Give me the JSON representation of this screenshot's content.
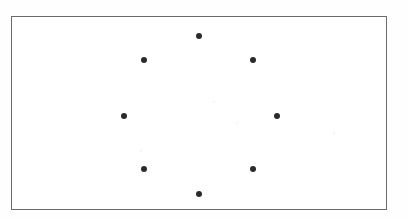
{
  "figure": {
    "canvas": {
      "width": 409,
      "height": 218
    },
    "background_color": "#ffffff",
    "frame": {
      "name": "plot-border",
      "x": 11,
      "y": 16,
      "width": 376,
      "height": 194,
      "border_color": "#6b6b6b",
      "border_width": 1.5,
      "fill_color": "#ffffff"
    },
    "marker_style": {
      "shape": "circle",
      "radius": 3.1,
      "color": "#2b2b2b",
      "count": 8
    }
  },
  "chart_data": {
    "type": "scatter",
    "title": "",
    "subtitle": "",
    "xlabel": "",
    "ylabel": "",
    "grid": false,
    "legend": null,
    "axes_visible": false,
    "frame_visible": true,
    "xlim": [
      11,
      387
    ],
    "ylim": [
      16,
      210
    ],
    "center": {
      "x": 200.5,
      "y": 115
    },
    "ring_radius_x": 77,
    "ring_radius_y": 79,
    "series": [
      {
        "name": "markers",
        "color": "#2b2b2b",
        "marker": "circle",
        "points": [
          {
            "label": "top",
            "angle_deg": 90,
            "x": 199,
            "y": 36
          },
          {
            "label": "upper-left",
            "angle_deg": 135,
            "x": 144,
            "y": 60
          },
          {
            "label": "upper-right",
            "angle_deg": 45,
            "x": 253,
            "y": 60
          },
          {
            "label": "left",
            "angle_deg": 180,
            "x": 124,
            "y": 116
          },
          {
            "label": "right",
            "angle_deg": 0,
            "x": 277,
            "y": 116
          },
          {
            "label": "lower-left",
            "angle_deg": 225,
            "x": 144,
            "y": 169
          },
          {
            "label": "lower-right",
            "angle_deg": 315,
            "x": 253,
            "y": 169
          },
          {
            "label": "bottom",
            "angle_deg": 270,
            "x": 199,
            "y": 194
          }
        ]
      }
    ]
  },
  "artifacts": {
    "speckles": [
      {
        "x": 213,
        "y": 101,
        "size": 2
      },
      {
        "x": 236,
        "y": 122,
        "size": 2
      },
      {
        "x": 240,
        "y": 125,
        "size": 1
      },
      {
        "x": 140,
        "y": 150,
        "size": 2
      },
      {
        "x": 111,
        "y": 178,
        "size": 1
      },
      {
        "x": 333,
        "y": 132,
        "size": 2
      },
      {
        "x": 398,
        "y": 96,
        "size": 1
      }
    ]
  }
}
